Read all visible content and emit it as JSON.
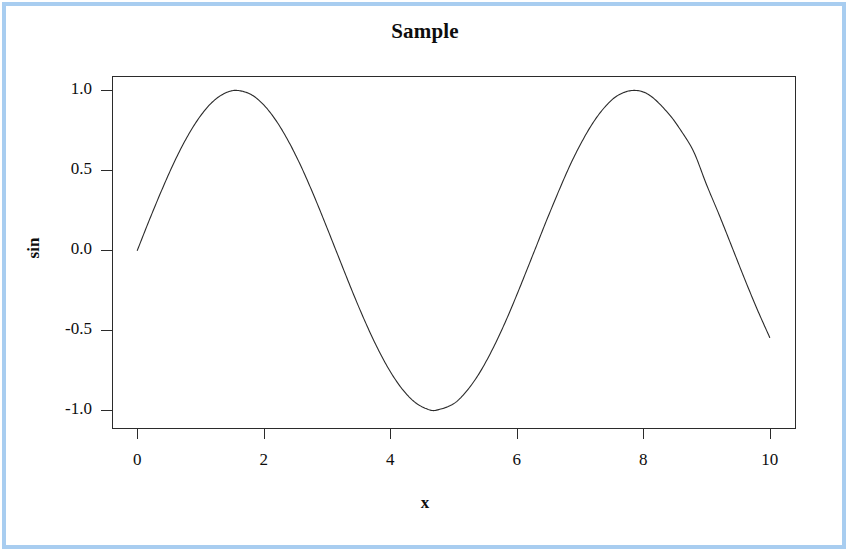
{
  "figure": {
    "width": 850,
    "height": 553,
    "background": "#ffffff",
    "frame_color": "#a8cdf0",
    "ink_color": "#2b2b2b"
  },
  "chart_data": {
    "type": "line",
    "title": "Sample",
    "xlabel": "x",
    "ylabel": "sin",
    "grid": false,
    "legend": null,
    "xlim": [
      -0.4,
      10.4
    ],
    "ylim": [
      -1.11,
      1.09
    ],
    "xticks": [
      0,
      2,
      4,
      6,
      8,
      10
    ],
    "xtick_labels": [
      "0",
      "2",
      "4",
      "6",
      "8",
      "10"
    ],
    "yticks": [
      1.0,
      0.5,
      0.0,
      -0.5,
      -1.0
    ],
    "ytick_labels": [
      "1.0",
      "0.5",
      "0.0",
      "-0.5",
      "-1.0"
    ],
    "series": [
      {
        "name": "sin",
        "line_color": "#2b2b2b",
        "line_width": 1,
        "x": [
          0.0,
          0.2,
          0.4,
          0.6,
          0.8,
          1.0,
          1.2,
          1.4,
          1.5708,
          1.8,
          2.0,
          2.2,
          2.4,
          2.6,
          2.8,
          3.0,
          3.1416,
          3.4,
          3.6,
          3.8,
          4.0,
          4.2,
          4.4,
          4.6,
          4.7124,
          5.0,
          5.2,
          5.4,
          5.6,
          5.8,
          6.0,
          6.2832,
          6.5,
          6.8,
          7.0,
          7.2,
          7.4,
          7.6,
          7.854,
          8.1,
          8.4,
          8.6,
          8.8,
          9.0,
          9.2,
          9.4248,
          9.6,
          9.8,
          10.0
        ],
        "y": [
          0.0,
          0.199,
          0.389,
          0.565,
          0.717,
          0.841,
          0.932,
          0.985,
          1.0,
          0.974,
          0.909,
          0.808,
          0.675,
          0.516,
          0.335,
          0.141,
          0.0,
          -0.256,
          -0.443,
          -0.612,
          -0.757,
          -0.872,
          -0.952,
          -0.994,
          -1.0,
          -0.959,
          -0.883,
          -0.773,
          -0.631,
          -0.465,
          -0.279,
          0.0,
          0.215,
          0.495,
          0.657,
          0.794,
          0.899,
          0.969,
          1.0,
          0.97,
          0.855,
          0.747,
          0.615,
          0.412,
          0.223,
          0.0,
          -0.175,
          -0.366,
          -0.544
        ]
      }
    ],
    "axis_box": {
      "left": 112,
      "right": 795,
      "top": 76,
      "bottom": 428,
      "border_color": "#2b2b2b",
      "border_width": 1
    },
    "notes": {
      "function": "sin(x)",
      "x_range_data": [
        0,
        10
      ],
      "peaks": [
        {
          "x": 1.5708,
          "y": 1.0
        },
        {
          "x": 7.854,
          "y": 1.0
        }
      ],
      "troughs": [
        {
          "x": 4.7124,
          "y": -1.0
        }
      ],
      "zero_crossings": [
        0.0,
        3.1416,
        6.2832,
        9.4248
      ],
      "endpoint_value": -0.544
    }
  }
}
